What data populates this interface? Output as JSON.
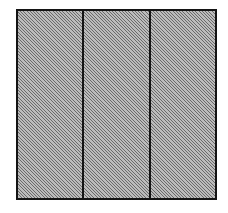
{
  "figure": {
    "kind": "hatched-rectangle-three-panels",
    "canvas": {
      "width_px": 228,
      "height_px": 213,
      "background_color": "#ffffff"
    },
    "outline": {
      "left_px": 16,
      "top_px": 9,
      "width_px": 201,
      "height_px": 191,
      "border_color": "#141414",
      "border_width_px": 2
    },
    "fill": {
      "base_color": "#9d9d9d",
      "hatch_color": "#464646",
      "hatch_angle_deg": 45,
      "hatch_spacing_px": 2.3,
      "hatch_direction": "lower-left-to-upper-right"
    },
    "dividers": {
      "count": 2,
      "color": "#141414",
      "width_px": 2,
      "x_positions_px": [
        85,
        151
      ],
      "orientation": "vertical"
    },
    "panels": [
      {
        "index": 1,
        "label": "",
        "hatched": true
      },
      {
        "index": 2,
        "label": "",
        "hatched": true
      },
      {
        "index": 3,
        "label": "",
        "hatched": true
      }
    ]
  }
}
